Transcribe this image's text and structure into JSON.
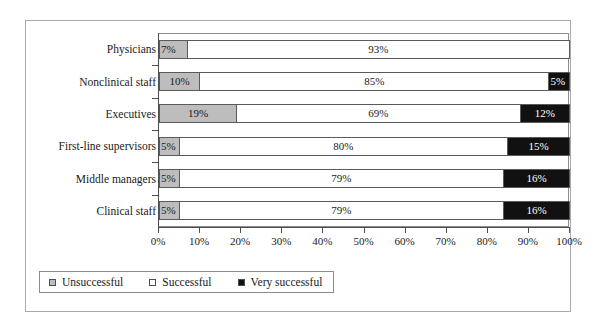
{
  "chart_data": {
    "type": "bar",
    "orientation": "horizontal",
    "stacked": true,
    "stack_mode": "percent",
    "title": "",
    "subtitle": "",
    "xlabel": "",
    "ylabel": "",
    "xlim": [
      0,
      100
    ],
    "grid": false,
    "legend_position": "bottom-left",
    "categories": [
      "Physicians",
      "Nonclinical staff",
      "Executives",
      "First-line supervisors",
      "Middle managers",
      "Clinical staff"
    ],
    "series": [
      {
        "name": "Unsuccessful",
        "color": "#bdbdbd",
        "values": [
          7,
          10,
          19,
          5,
          5,
          5
        ],
        "labels": [
          "7%",
          "10%",
          "19%",
          "5%",
          "5%",
          "5%"
        ]
      },
      {
        "name": "Successful",
        "color": "#ffffff",
        "values": [
          93,
          85,
          69,
          80,
          79,
          79
        ],
        "labels": [
          "93%",
          "85%",
          "69%",
          "80%",
          "79%",
          "79%"
        ]
      },
      {
        "name": "Very successful",
        "color": "#111111",
        "values": [
          0,
          5,
          12,
          15,
          16,
          16
        ],
        "labels": [
          "",
          "5%",
          "12%",
          "15%",
          "16%",
          "16%"
        ]
      }
    ],
    "xticks": [
      0,
      10,
      20,
      30,
      40,
      50,
      60,
      70,
      80,
      90,
      100
    ],
    "xticklabels": [
      "0%",
      "10%",
      "20%",
      "30%",
      "40%",
      "50%",
      "60%",
      "70%",
      "80%",
      "90%",
      "100%"
    ]
  },
  "legend": {
    "items": [
      {
        "label": "Unsuccessful",
        "swatch": "gray-square-icon"
      },
      {
        "label": "Successful",
        "swatch": "white-square-icon"
      },
      {
        "label": "Very successful",
        "swatch": "black-square-icon"
      }
    ]
  }
}
